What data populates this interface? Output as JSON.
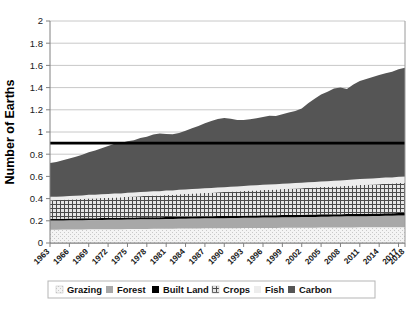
{
  "chart_data": {
    "type": "area",
    "title": "",
    "xlabel": "",
    "ylabel": "Number of Earths",
    "ylim": [
      0,
      2
    ],
    "ytick_values": [
      0,
      0.2,
      0.4,
      0.6,
      0.8,
      1,
      1.2,
      1.4,
      1.6,
      1.8,
      2
    ],
    "ytick_labels": [
      "0",
      "0.2",
      "0.4",
      "0.6",
      "0.8",
      "1",
      "1.2",
      "1.4",
      "1.6",
      "1.8",
      "2"
    ],
    "grid": true,
    "stacked": true,
    "legend_position": "bottom",
    "categories": [
      "1963",
      "1964",
      "1965",
      "1966",
      "1967",
      "1968",
      "1969",
      "1970",
      "1971",
      "1972",
      "1973",
      "1974",
      "1975",
      "1976",
      "1977",
      "1978",
      "1979",
      "1980",
      "1981",
      "1982",
      "1983",
      "1984",
      "1985",
      "1986",
      "1987",
      "1988",
      "1989",
      "1990",
      "1991",
      "1992",
      "1993",
      "1994",
      "1995",
      "1996",
      "1997",
      "1998",
      "1999",
      "2000",
      "2001",
      "2002",
      "2003",
      "2004",
      "2005",
      "2006",
      "2007",
      "2008",
      "2009",
      "2010",
      "2011",
      "2012",
      "2013",
      "2014",
      "2015",
      "2016",
      "2017",
      "2018"
    ],
    "xtick_labels": [
      "1963",
      "1966",
      "1969",
      "1972",
      "1975",
      "1978",
      "1981",
      "1984",
      "1987",
      "1990",
      "1993",
      "1996",
      "1999",
      "2002",
      "2005",
      "2008",
      "2011",
      "2014",
      "2017",
      "2018"
    ],
    "series": [
      {
        "name": "Grazing",
        "fill": "#f2f2f2",
        "pattern": "dots-fine",
        "values": [
          0.12,
          0.12,
          0.121,
          0.121,
          0.122,
          0.122,
          0.123,
          0.123,
          0.124,
          0.124,
          0.125,
          0.125,
          0.126,
          0.126,
          0.127,
          0.127,
          0.128,
          0.128,
          0.129,
          0.129,
          0.13,
          0.13,
          0.131,
          0.131,
          0.132,
          0.132,
          0.133,
          0.133,
          0.134,
          0.134,
          0.135,
          0.135,
          0.135,
          0.136,
          0.136,
          0.136,
          0.137,
          0.137,
          0.137,
          0.138,
          0.138,
          0.138,
          0.139,
          0.139,
          0.139,
          0.14,
          0.14,
          0.14,
          0.141,
          0.141,
          0.141,
          0.142,
          0.142,
          0.142,
          0.143,
          0.143
        ]
      },
      {
        "name": "Forest",
        "fill": "#a8a8a8",
        "pattern": "solid",
        "values": [
          0.082,
          0.082,
          0.082,
          0.083,
          0.083,
          0.083,
          0.084,
          0.084,
          0.084,
          0.085,
          0.085,
          0.085,
          0.086,
          0.086,
          0.086,
          0.087,
          0.087,
          0.087,
          0.088,
          0.088,
          0.089,
          0.089,
          0.089,
          0.09,
          0.09,
          0.09,
          0.091,
          0.091,
          0.092,
          0.092,
          0.092,
          0.093,
          0.093,
          0.094,
          0.094,
          0.094,
          0.095,
          0.095,
          0.096,
          0.096,
          0.097,
          0.097,
          0.098,
          0.098,
          0.099,
          0.099,
          0.1,
          0.1,
          0.101,
          0.101,
          0.102,
          0.102,
          0.103,
          0.103,
          0.104,
          0.104
        ]
      },
      {
        "name": "Built Land",
        "fill": "#000000",
        "pattern": "solid",
        "values": [
          0.016,
          0.016,
          0.016,
          0.016,
          0.016,
          0.017,
          0.017,
          0.017,
          0.017,
          0.017,
          0.017,
          0.017,
          0.018,
          0.018,
          0.018,
          0.018,
          0.018,
          0.018,
          0.018,
          0.018,
          0.019,
          0.019,
          0.019,
          0.019,
          0.019,
          0.019,
          0.019,
          0.019,
          0.019,
          0.019,
          0.019,
          0.02,
          0.02,
          0.02,
          0.02,
          0.02,
          0.02,
          0.02,
          0.02,
          0.02,
          0.021,
          0.021,
          0.021,
          0.021,
          0.021,
          0.021,
          0.021,
          0.022,
          0.022,
          0.022,
          0.022,
          0.022,
          0.022,
          0.022,
          0.023,
          0.023
        ]
      },
      {
        "name": "Crops",
        "fill": "#d0d0d0",
        "pattern": "grid-hatch",
        "values": [
          0.168,
          0.169,
          0.17,
          0.172,
          0.173,
          0.175,
          0.177,
          0.178,
          0.18,
          0.182,
          0.184,
          0.185,
          0.187,
          0.189,
          0.191,
          0.193,
          0.195,
          0.196,
          0.198,
          0.2,
          0.202,
          0.204,
          0.206,
          0.208,
          0.21,
          0.212,
          0.214,
          0.216,
          0.218,
          0.22,
          0.222,
          0.224,
          0.226,
          0.228,
          0.23,
          0.232,
          0.234,
          0.236,
          0.238,
          0.24,
          0.242,
          0.244,
          0.246,
          0.248,
          0.25,
          0.252,
          0.254,
          0.256,
          0.258,
          0.26,
          0.262,
          0.264,
          0.266,
          0.268,
          0.27,
          0.272
        ]
      },
      {
        "name": "Fish",
        "fill": "#ededed",
        "pattern": "solid",
        "values": [
          0.03,
          0.03,
          0.031,
          0.031,
          0.032,
          0.032,
          0.033,
          0.033,
          0.034,
          0.034,
          0.035,
          0.035,
          0.036,
          0.036,
          0.037,
          0.037,
          0.038,
          0.038,
          0.039,
          0.039,
          0.04,
          0.04,
          0.041,
          0.041,
          0.042,
          0.042,
          0.043,
          0.043,
          0.044,
          0.044,
          0.045,
          0.045,
          0.046,
          0.046,
          0.047,
          0.047,
          0.048,
          0.048,
          0.049,
          0.049,
          0.05,
          0.05,
          0.051,
          0.051,
          0.052,
          0.052,
          0.053,
          0.053,
          0.054,
          0.054,
          0.055,
          0.055,
          0.056,
          0.056,
          0.057,
          0.057
        ]
      },
      {
        "name": "Carbon",
        "fill": "#555555",
        "pattern": "solid",
        "values": [
          0.304,
          0.313,
          0.325,
          0.338,
          0.351,
          0.366,
          0.383,
          0.398,
          0.414,
          0.432,
          0.449,
          0.455,
          0.463,
          0.47,
          0.486,
          0.495,
          0.512,
          0.52,
          0.509,
          0.505,
          0.512,
          0.53,
          0.548,
          0.566,
          0.585,
          0.604,
          0.617,
          0.624,
          0.612,
          0.6,
          0.594,
          0.598,
          0.604,
          0.611,
          0.62,
          0.615,
          0.626,
          0.64,
          0.65,
          0.668,
          0.712,
          0.75,
          0.782,
          0.806,
          0.83,
          0.838,
          0.82,
          0.856,
          0.884,
          0.9,
          0.914,
          0.928,
          0.94,
          0.952,
          0.968,
          0.979
        ]
      }
    ],
    "reference_line": {
      "name": "World Biocapacity",
      "value": 0.9,
      "color": "#000000"
    },
    "totals_note": {
      "first_year_total": 0.72,
      "last_year_total": 1.755
    }
  },
  "legend": {
    "items": [
      {
        "label": "Grazing"
      },
      {
        "label": "Forest"
      },
      {
        "label": "Built Land"
      },
      {
        "label": "Crops"
      },
      {
        "label": "Fish"
      },
      {
        "label": "Carbon"
      }
    ]
  }
}
